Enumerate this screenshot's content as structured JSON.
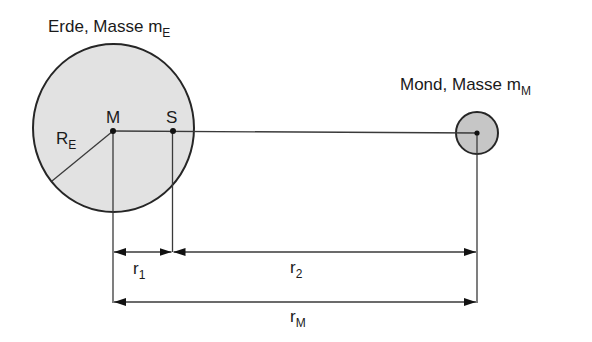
{
  "diagram": {
    "earth": {
      "title": "Erde, Masse m",
      "title_sub": "E",
      "fill": "#e2e2e2",
      "center": [
        113,
        128
      ],
      "radius": 81
    },
    "moon": {
      "title": "Mond, Masse m",
      "title_sub": "M",
      "fill": "#c6c6c6",
      "center": [
        477,
        133
      ],
      "radius": 21
    },
    "points": {
      "earth_center": "M",
      "barycenter": "S"
    },
    "radius_label": {
      "main": "R",
      "sub": "E"
    },
    "distances": [
      {
        "main": "r",
        "sub": "1"
      },
      {
        "main": "r",
        "sub": "2"
      },
      {
        "main": "r",
        "sub": "M"
      }
    ]
  }
}
